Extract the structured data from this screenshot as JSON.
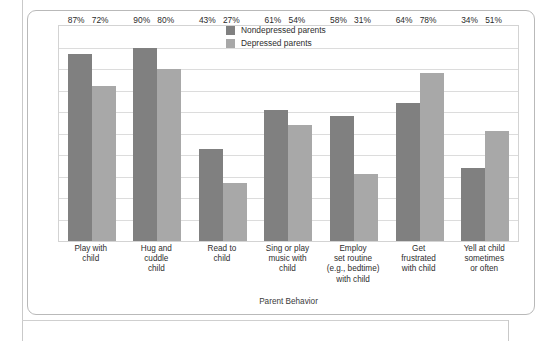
{
  "chart_data": {
    "type": "bar",
    "title": "",
    "xlabel": "Parent Behavior",
    "ylabel": "Percentage Who Act This Way Every Day",
    "ylim": [
      0,
      100
    ],
    "grid": true,
    "legend_position": "top-right",
    "gridline_count": 10,
    "categories": [
      "Play with child",
      "Hug and cuddle child",
      "Read to child",
      "Sing or play music with child",
      "Employ set routine (e.g., bedtime) with child",
      "Get frustrated with child",
      "Yell at child sometimes or often"
    ],
    "category_lines": [
      [
        "Play with",
        "child"
      ],
      [
        "Hug and",
        "cuddle",
        "child"
      ],
      [
        "Read to",
        "child"
      ],
      [
        "Sing or play",
        "music with",
        "child"
      ],
      [
        "Employ",
        "set routine",
        "(e.g., bedtime)",
        "with child"
      ],
      [
        "Get",
        "frustrated",
        "with child"
      ],
      [
        "Yell at child",
        "sometimes",
        "or often"
      ]
    ],
    "series": [
      {
        "name": "Nondepressed parents",
        "color": "#808080",
        "values": [
          87,
          90,
          43,
          61,
          58,
          64,
          34
        ],
        "labels": [
          "87%",
          "90%",
          "43%",
          "61%",
          "58%",
          "64%",
          "34%"
        ]
      },
      {
        "name": "Depressed parents",
        "color": "#a8a8a8",
        "values": [
          72,
          80,
          27,
          54,
          31,
          78,
          51
        ],
        "labels": [
          "72%",
          "80%",
          "27%",
          "54%",
          "31%",
          "78%",
          "51%"
        ]
      }
    ]
  }
}
